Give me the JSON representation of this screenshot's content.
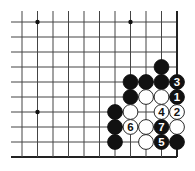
{
  "diagram": {
    "type": "go-board-corner",
    "grid": {
      "columns": 11,
      "rows": 10,
      "origin_x": 22,
      "origin_y": 22,
      "spacing_x": 15.5,
      "spacing_y": 15,
      "line_left_extent": 11,
      "line_top_extent": 11,
      "edges": [
        "right",
        "bottom"
      ],
      "line_color": "#444444",
      "edge_color": "#222222"
    },
    "star_points": [
      {
        "col": 1,
        "row": 0
      },
      {
        "col": 7,
        "row": 0
      },
      {
        "col": 1,
        "row": 6
      }
    ],
    "stones": [
      {
        "col": 9,
        "row": 3,
        "color": "black",
        "label": ""
      },
      {
        "col": 7,
        "row": 4,
        "color": "black",
        "label": ""
      },
      {
        "col": 8,
        "row": 4,
        "color": "black",
        "label": ""
      },
      {
        "col": 9,
        "row": 4,
        "color": "black",
        "label": ""
      },
      {
        "col": 10,
        "row": 4,
        "color": "black",
        "label": "3"
      },
      {
        "col": 7,
        "row": 5,
        "color": "black",
        "label": ""
      },
      {
        "col": 8,
        "row": 5,
        "color": "white",
        "label": ""
      },
      {
        "col": 9,
        "row": 5,
        "color": "white",
        "label": ""
      },
      {
        "col": 10,
        "row": 5,
        "color": "black",
        "label": "1"
      },
      {
        "col": 6,
        "row": 6,
        "color": "black",
        "label": ""
      },
      {
        "col": 7,
        "row": 6,
        "color": "white",
        "label": ""
      },
      {
        "col": 9,
        "row": 6,
        "color": "white",
        "label": "4"
      },
      {
        "col": 10,
        "row": 6,
        "color": "white",
        "label": "2"
      },
      {
        "col": 6,
        "row": 7,
        "color": "black",
        "label": ""
      },
      {
        "col": 7,
        "row": 7,
        "color": "white",
        "label": "6"
      },
      {
        "col": 8,
        "row": 7,
        "color": "white",
        "label": ""
      },
      {
        "col": 9,
        "row": 7,
        "color": "black",
        "label": "7"
      },
      {
        "col": 10,
        "row": 7,
        "color": "white",
        "label": ""
      },
      {
        "col": 6,
        "row": 8,
        "color": "black",
        "label": ""
      },
      {
        "col": 8,
        "row": 8,
        "color": "white",
        "label": ""
      },
      {
        "col": 9,
        "row": 8,
        "color": "black",
        "label": "5"
      },
      {
        "col": 10,
        "row": 8,
        "color": "black",
        "label": ""
      }
    ]
  }
}
